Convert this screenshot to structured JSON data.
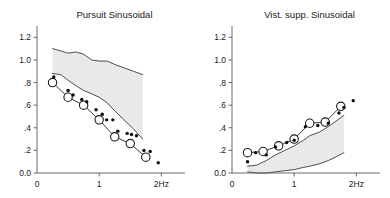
{
  "figure": {
    "panels": [
      {
        "id": "pursuit",
        "title": "Pursuit Sinusoidal",
        "axis": {
          "x_label": "",
          "y_label": "",
          "xlim": [
            0,
            2.3
          ],
          "ylim": [
            0.0,
            1.3
          ],
          "x_ticks": [
            0,
            1,
            2
          ],
          "x_tick_labels": [
            "0",
            "1",
            "2Hz"
          ],
          "y_ticks": [
            0.0,
            0.2,
            0.4,
            0.6,
            0.8,
            1.0,
            1.2
          ],
          "y_tick_labels": [
            "0.0",
            ".2",
            ".4",
            ".6",
            ".8",
            "1.0",
            "1.2"
          ],
          "grid": false
        },
        "band": {
          "name": "normal-range-band",
          "fill_color": "#e9e9e9",
          "x": [
            0.25,
            0.38,
            0.5,
            0.63,
            0.75,
            0.88,
            1.0,
            1.13,
            1.25,
            1.4,
            1.55,
            1.7
          ],
          "upper": [
            1.1,
            1.08,
            1.06,
            1.07,
            1.05,
            1.0,
            0.99,
            0.99,
            0.96,
            0.93,
            0.9,
            0.87
          ],
          "lower": [
            0.88,
            0.87,
            0.82,
            0.77,
            0.73,
            0.7,
            0.67,
            0.62,
            0.55,
            0.47,
            0.39,
            0.3
          ]
        },
        "series": [
          {
            "name": "patient-mean-open-circles",
            "marker": "open-circle",
            "connected": true,
            "x": [
              0.25,
              0.5,
              0.75,
              1.0,
              1.25,
              1.5,
              1.75
            ],
            "y": [
              0.8,
              0.67,
              0.6,
              0.47,
              0.32,
              0.26,
              0.14
            ]
          },
          {
            "name": "individual-trials-dots",
            "marker": "filled-dot",
            "connected": false,
            "x": [
              0.27,
              0.5,
              0.58,
              0.72,
              0.8,
              0.95,
              1.05,
              1.12,
              1.22,
              1.3,
              1.45,
              1.52,
              1.6,
              1.72,
              1.82,
              1.95
            ],
            "y": [
              0.85,
              0.73,
              0.69,
              0.65,
              0.63,
              0.56,
              0.52,
              0.47,
              0.47,
              0.37,
              0.35,
              0.34,
              0.33,
              0.2,
              0.19,
              0.09
            ]
          }
        ]
      },
      {
        "id": "vist-supp",
        "title": "Vist. supp. Sinusoidal",
        "axis": {
          "x_label": "",
          "y_label": "",
          "xlim": [
            0,
            2.3
          ],
          "ylim": [
            0.0,
            1.3
          ],
          "x_ticks": [
            0,
            1,
            2
          ],
          "x_tick_labels": [
            "0",
            "1",
            "2Hz"
          ],
          "y_ticks": [
            0.0,
            0.2,
            0.4,
            0.6,
            0.8,
            1.0,
            1.2
          ],
          "y_tick_labels": [
            "0.0",
            ".2",
            ".4",
            ".6",
            ".8",
            "1.0",
            "1.2"
          ],
          "grid": false
        },
        "band": {
          "name": "normal-range-band",
          "fill_color": "#e9e9e9",
          "x": [
            0.25,
            0.4,
            0.55,
            0.7,
            0.85,
            1.0,
            1.15,
            1.25,
            1.4,
            1.55,
            1.7,
            1.8
          ],
          "upper": [
            0.06,
            0.07,
            0.11,
            0.16,
            0.2,
            0.24,
            0.29,
            0.33,
            0.36,
            0.41,
            0.47,
            0.51
          ],
          "lower": [
            0.01,
            0.0,
            0.0,
            0.01,
            0.02,
            0.03,
            0.05,
            0.06,
            0.08,
            0.11,
            0.15,
            0.18
          ]
        },
        "series": [
          {
            "name": "patient-mean-open-circles",
            "marker": "open-circle",
            "connected": true,
            "x": [
              0.25,
              0.5,
              0.75,
              1.0,
              1.25,
              1.5,
              1.75
            ],
            "y": [
              0.18,
              0.19,
              0.24,
              0.3,
              0.44,
              0.45,
              0.59
            ]
          },
          {
            "name": "individual-trials-dots",
            "marker": "filled-dot",
            "connected": false,
            "x": [
              0.25,
              0.38,
              0.55,
              0.7,
              0.88,
              1.0,
              1.18,
              1.38,
              1.55,
              1.72,
              1.8,
              1.95
            ],
            "y": [
              0.1,
              0.18,
              0.16,
              0.23,
              0.27,
              0.29,
              0.41,
              0.42,
              0.44,
              0.53,
              0.58,
              0.64
            ]
          }
        ]
      }
    ]
  }
}
